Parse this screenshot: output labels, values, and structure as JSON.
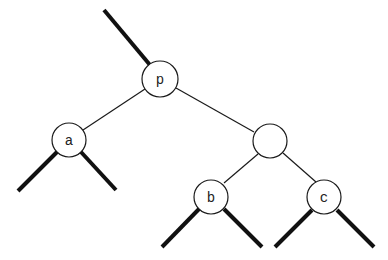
{
  "diagram": {
    "type": "binary-tree",
    "colors": {
      "stroke": "#1a1a1a",
      "fill": "#ffffff",
      "text": "#222222"
    },
    "nodes": [
      {
        "id": "p",
        "label": "p",
        "cx": 160,
        "cy": 79,
        "r": 18
      },
      {
        "id": "a",
        "label": "a",
        "cx": 69,
        "cy": 140,
        "r": 17
      },
      {
        "id": "q",
        "label": "",
        "cx": 270,
        "cy": 141,
        "r": 17
      },
      {
        "id": "b",
        "label": "b",
        "cx": 211,
        "cy": 197,
        "r": 17
      },
      {
        "id": "c",
        "label": "c",
        "cx": 324,
        "cy": 197,
        "r": 17
      }
    ],
    "edges": [
      {
        "from": "p",
        "to": "a",
        "style": "thin"
      },
      {
        "from": "p",
        "to": "q",
        "style": "thin"
      },
      {
        "from": "q",
        "to": "b",
        "style": "thin"
      },
      {
        "from": "q",
        "to": "c",
        "style": "thin"
      }
    ],
    "subtree_stubs": [
      {
        "attached_to": "p",
        "direction": "parent"
      },
      {
        "attached_to": "a",
        "direction": "left"
      },
      {
        "attached_to": "a",
        "direction": "right"
      },
      {
        "attached_to": "b",
        "direction": "left"
      },
      {
        "attached_to": "b",
        "direction": "right"
      },
      {
        "attached_to": "c",
        "direction": "left"
      },
      {
        "attached_to": "c",
        "direction": "right"
      }
    ]
  }
}
